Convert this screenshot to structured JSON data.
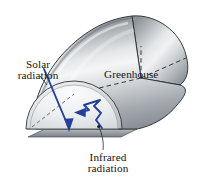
{
  "figure": {
    "type": "technical-illustration",
    "background_color": "#ffffff",
    "labels": {
      "solar": {
        "line1": "Solar",
        "line2": "radiation"
      },
      "greenhouse": {
        "line1": "Greenhouse"
      },
      "infrared": {
        "line1": "Infrared",
        "line2": "radiation"
      }
    },
    "colors": {
      "arrow_blue": "#24409a",
      "outline": "#1d1d1d",
      "leader": "#1d1d1d",
      "shell_light": "#f2f3f4",
      "shell_mid": "#c4c8cb",
      "shell_dark": "#7d8388",
      "end_face_light": "#e8ebee",
      "base_gray": "#8f959a"
    },
    "annotations": {
      "solar_arrow": "straight blue arrow entering through the glazing, pointing down-right into the enclosure",
      "infrared_arrow": "blue zigzag arrow inside the enclosure pointing up-left, trapped radiation",
      "dashed_lines": "hidden construction edges of the half-cylinder",
      "leader_solar": "thin line from Solar radiation text to the incoming beam",
      "leader_infrared": "thin curved line from Infrared radiation text to the zigzag arrow"
    }
  }
}
